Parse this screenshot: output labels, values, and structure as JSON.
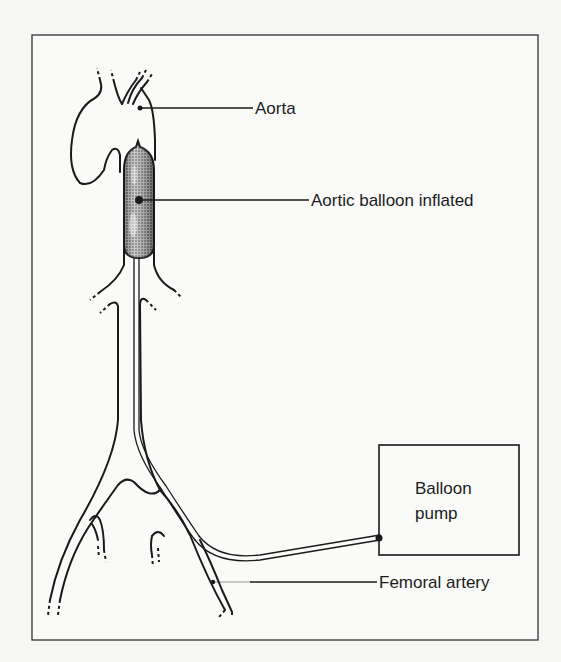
{
  "diagram": {
    "type": "anatomical illustration",
    "frame_color": "#333333",
    "labels": {
      "aorta": "Aorta",
      "balloon": "Aortic balloon inflated",
      "femoral": "Femoral artery",
      "pump_line1": "Balloon",
      "pump_line2": "pump"
    },
    "colors": {
      "background": "#f7f7f5",
      "line": "#1a1a1a",
      "balloon_fill": "#8c8c8c"
    }
  }
}
